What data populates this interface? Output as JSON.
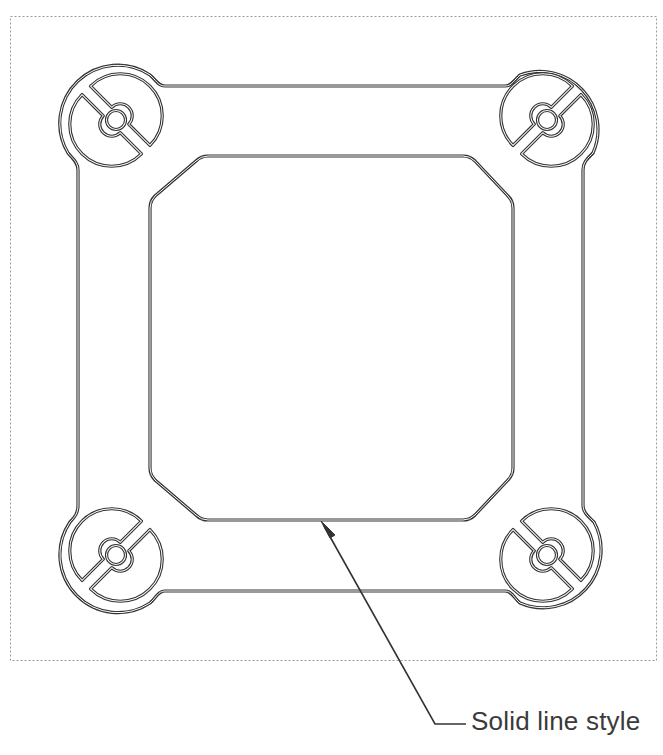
{
  "diagram": {
    "type": "technical-drawing",
    "line_color": "#333333",
    "frame_border_color": "#9a9a9a",
    "frame_border_style": "dotted",
    "callout": {
      "label": "Solid line style",
      "target": "inner-opening-bottom-edge"
    },
    "components": {
      "outer_profile": "rounded square frame with four circular corner lobes",
      "corner_lobes": [
        {
          "position": "top-left",
          "feature": "split circular slot with center hole, slot angled 45deg"
        },
        {
          "position": "top-right",
          "feature": "split circular slot with center hole, slot angled -45deg"
        },
        {
          "position": "bottom-left",
          "feature": "split circular slot with center hole, slot angled -45deg"
        },
        {
          "position": "bottom-right",
          "feature": "split circular slot with center hole, slot angled 45deg"
        }
      ],
      "inner_opening": "square opening with chamfered corners (octagon)"
    }
  }
}
